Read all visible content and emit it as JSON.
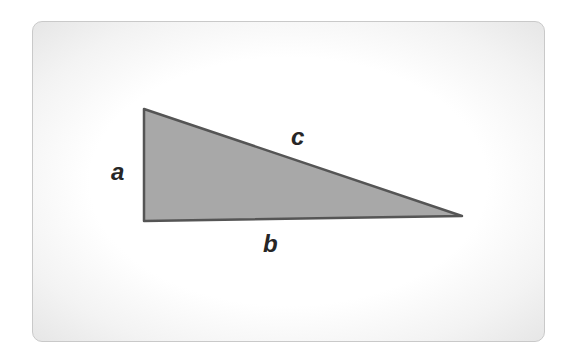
{
  "diagram": {
    "colors": {
      "fill": "#a8a8a8",
      "stroke": "#555555",
      "label": "#262626",
      "card_border": "#c9c9c9"
    },
    "vertices": {
      "top": [
        143,
        109
      ],
      "right_angle": [
        144,
        221
      ],
      "far": [
        462,
        216
      ]
    },
    "labels": {
      "a": "a",
      "b": "b",
      "c": "c"
    }
  }
}
